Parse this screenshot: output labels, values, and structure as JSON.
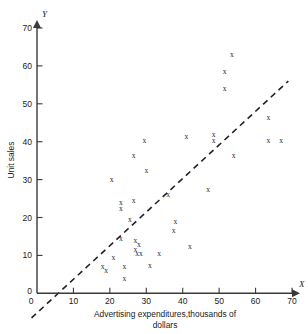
{
  "chart_data": {
    "type": "scatter",
    "title": "",
    "xlabel": "Advertising expenditures,thousands of",
    "xlabel_line2": "dollars",
    "ylabel": "Unit sales",
    "x_axis_name": "X",
    "y_axis_name": "Y",
    "xlim": [
      0,
      70
    ],
    "ylim": [
      0,
      70
    ],
    "xticks": [
      0,
      10,
      20,
      30,
      40,
      50,
      60,
      70
    ],
    "yticks": [
      0,
      10,
      20,
      30,
      40,
      50,
      60,
      70
    ],
    "grid": false,
    "legend": null,
    "marker_glyph": "x",
    "points": [
      {
        "x": 18.0,
        "y": 7.0
      },
      {
        "x": 19.0,
        "y": 6.0
      },
      {
        "x": 20.5,
        "y": 30.0
      },
      {
        "x": 21.0,
        "y": 9.5
      },
      {
        "x": 23.0,
        "y": 24.0
      },
      {
        "x": 23.0,
        "y": 22.5
      },
      {
        "x": 23.0,
        "y": 14.5
      },
      {
        "x": 24.0,
        "y": 7.0
      },
      {
        "x": 24.0,
        "y": 4.0
      },
      {
        "x": 25.5,
        "y": 19.5
      },
      {
        "x": 26.5,
        "y": 24.5
      },
      {
        "x": 26.5,
        "y": 36.5
      },
      {
        "x": 27.0,
        "y": 14.0
      },
      {
        "x": 27.0,
        "y": 11.5
      },
      {
        "x": 27.5,
        "y": 10.5
      },
      {
        "x": 28.5,
        "y": 10.5
      },
      {
        "x": 28.0,
        "y": 13.0
      },
      {
        "x": 29.5,
        "y": 40.5
      },
      {
        "x": 30.0,
        "y": 32.5
      },
      {
        "x": 31.0,
        "y": 7.5
      },
      {
        "x": 33.5,
        "y": 10.5
      },
      {
        "x": 36.0,
        "y": 26.0
      },
      {
        "x": 37.5,
        "y": 16.5
      },
      {
        "x": 38.0,
        "y": 19.0
      },
      {
        "x": 41.0,
        "y": 41.5
      },
      {
        "x": 42.0,
        "y": 12.5
      },
      {
        "x": 47.0,
        "y": 27.5
      },
      {
        "x": 48.5,
        "y": 42.0
      },
      {
        "x": 48.5,
        "y": 40.5
      },
      {
        "x": 51.5,
        "y": 58.5
      },
      {
        "x": 51.5,
        "y": 54.0
      },
      {
        "x": 53.5,
        "y": 63.0
      },
      {
        "x": 54.0,
        "y": 36.5
      },
      {
        "x": 63.5,
        "y": 46.5
      },
      {
        "x": 63.5,
        "y": 40.5
      },
      {
        "x": 67.0,
        "y": 40.5
      }
    ],
    "fit_line": {
      "style": "dashed",
      "x_start": -1.5,
      "y_start": -6.5,
      "x_end": 69.0,
      "y_end": 56.0
    }
  }
}
